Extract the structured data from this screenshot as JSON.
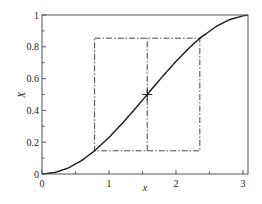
{
  "chart_data": {
    "type": "line",
    "title": "",
    "xlabel": "x",
    "ylabel": "X",
    "xlim": [
      0,
      3.075
    ],
    "ylim": [
      0,
      1
    ],
    "grid": false,
    "legend": null,
    "x_ticks": [
      {
        "value": 0,
        "label": "0"
      },
      {
        "value": 1,
        "label": "1"
      },
      {
        "value": 2,
        "label": "2"
      },
      {
        "value": 3,
        "label": "3"
      }
    ],
    "x_minor_ticks": [
      0.5,
      1.5,
      2.5
    ],
    "y_ticks": [
      {
        "value": 0,
        "label": "0"
      },
      {
        "value": 0.2,
        "label": "0.2"
      },
      {
        "value": 0.4,
        "label": "0.4"
      },
      {
        "value": 0.6,
        "label": "0.6"
      },
      {
        "value": 0.8,
        "label": "0.8"
      },
      {
        "value": 1,
        "label": "1"
      }
    ],
    "y_minor_ticks": [
      0.1,
      0.3,
      0.5,
      0.7,
      0.9
    ],
    "series": [
      {
        "name": "X(x)",
        "style": "solid",
        "color": "#1a1a1a",
        "x": [
          0,
          0.2,
          0.4,
          0.6,
          0.785,
          1.0,
          1.2,
          1.4,
          1.571,
          1.8,
          2.0,
          2.2,
          2.356,
          2.6,
          2.8,
          3.0,
          3.075
        ],
        "y": [
          0,
          0.01,
          0.039,
          0.087,
          0.146,
          0.23,
          0.319,
          0.415,
          0.5,
          0.614,
          0.708,
          0.794,
          0.854,
          0.928,
          0.971,
          0.995,
          0.999
        ]
      }
    ],
    "annotations": [
      {
        "type": "dashdot-rectangle",
        "x0": 0.785,
        "x1": 2.356,
        "y0": 0.146,
        "y1": 0.854,
        "color": "#333333"
      },
      {
        "type": "dashdot-vline",
        "x": 1.571,
        "y0": 0.146,
        "y1": 0.854,
        "color": "#333333"
      },
      {
        "type": "cross-marker",
        "x": 1.571,
        "y": 0.5
      }
    ]
  }
}
